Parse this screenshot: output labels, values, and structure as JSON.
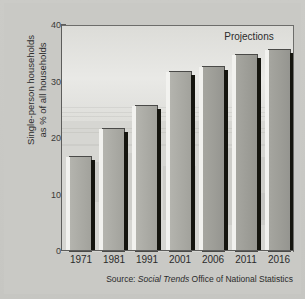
{
  "chart_data": {
    "type": "bar",
    "title": "",
    "xlabel": "",
    "ylabel": "Single-person households as % of all households",
    "ylabel_line1": "Single-person households",
    "ylabel_line2": "as % of all households",
    "categories": [
      "1971",
      "1981",
      "1991",
      "2001",
      "2006",
      "2011",
      "2016"
    ],
    "values": [
      17,
      22,
      26,
      32,
      33,
      35,
      36
    ],
    "series": [
      {
        "name": "Single-person households as % of all households",
        "values": [
          17,
          22,
          26,
          32,
          33,
          35,
          36
        ]
      }
    ],
    "ylim": [
      0,
      40
    ],
    "yticks": [
      0,
      10,
      20,
      30,
      40
    ],
    "ytick_labels": [
      "0",
      "10",
      "20",
      "30",
      "40"
    ],
    "grid": false,
    "legend": false,
    "projected_categories": [
      "2006",
      "2011",
      "2016"
    ],
    "annotations": [
      {
        "text": "Projections",
        "position": "top-right"
      }
    ]
  },
  "annotation": {
    "projections_label": "Projections"
  },
  "source": {
    "prefix": "Source:",
    "publication": "Social Trends",
    "organisation": "Office of National Statistics"
  }
}
